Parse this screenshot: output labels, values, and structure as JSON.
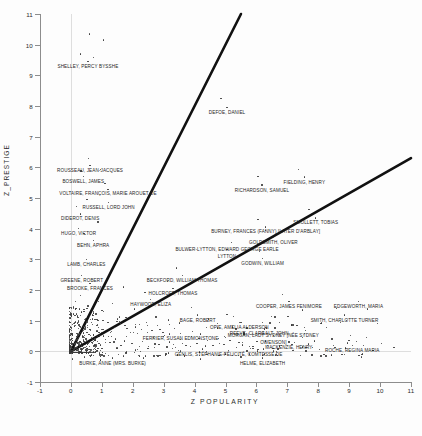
{
  "chart_data": {
    "type": "scatter",
    "title": "",
    "xlabel": "Z  POPULARITY",
    "ylabel": "Z_PRESTIGE",
    "xlim": [
      -1,
      11
    ],
    "ylim": [
      -1,
      11
    ],
    "xticks": [
      -1,
      0,
      1,
      2,
      3,
      4,
      5,
      6,
      7,
      8,
      9,
      10,
      11
    ],
    "ytick_labels": [
      "-1",
      "0",
      "1",
      "2",
      "3",
      "4",
      "5",
      "6",
      "7",
      "8",
      "9",
      "10",
      "11"
    ],
    "xtick_labels": [
      "-1",
      "0",
      "1",
      "2",
      "3",
      "4",
      "5",
      "6",
      "7",
      "8",
      "9",
      "10",
      "11"
    ],
    "yticks": [
      -1,
      0,
      1,
      2,
      3,
      4,
      5,
      6,
      7,
      8,
      9,
      10,
      11
    ],
    "grid": "faint gridlines at x=0 and y=0",
    "legend": "none",
    "reference_lines": [
      {
        "name": "steep-reference-line",
        "x0": 0,
        "y0": 0,
        "x1": 5.5,
        "y1": 11.0
      },
      {
        "name": "shallow-reference-line",
        "x0": 0,
        "y0": 0,
        "x1": 11.0,
        "y1": 6.3
      }
    ],
    "labeled_points": [
      {
        "label": "SHELLEY, PERCY BYSSHE",
        "x": 0.55,
        "y": 9.45
      },
      {
        "label": "DEFOE, DANIEL",
        "x": 5.05,
        "y": 7.95
      },
      {
        "label": "ROUSSEAU, JEAN-JACQUES",
        "x": 0.62,
        "y": 6.05
      },
      {
        "label": "BOSWELL, JAMES",
        "x": 0.4,
        "y": 5.7
      },
      {
        "label": "VOLTAIRE, FRANÇOIS, MARIE AROUET DE",
        "x": 1.2,
        "y": 5.28
      },
      {
        "label": "RUSSELL, LORD JOHN",
        "x": 1.22,
        "y": 4.86
      },
      {
        "label": "DIDEROT, DENIS",
        "x": 0.3,
        "y": 4.48
      },
      {
        "label": "HUGO, VICTOR",
        "x": 0.25,
        "y": 4.0
      },
      {
        "label": "BEHN, APHRA",
        "x": 0.72,
        "y": 3.62
      },
      {
        "label": "RICHARDSON, SAMUEL",
        "x": 6.18,
        "y": 5.42
      },
      {
        "label": "FIELDING, HENRY",
        "x": 7.55,
        "y": 5.68
      },
      {
        "label": "SMOLLETT, TOBIAS",
        "x": 7.92,
        "y": 4.35
      },
      {
        "label": "BURNEY, FRANCES (FANNY) [LATER D'ARBLAY]",
        "x": 6.3,
        "y": 4.05
      },
      {
        "label": "GOLDSMITH, OLIVER",
        "x": 6.55,
        "y": 3.72
      },
      {
        "label": "BULWER-LYTTON, EDWARD GEORGE EARLE LYTTON",
        "x": 5.05,
        "y": 3.32
      },
      {
        "label": "GODWIN, WILLIAM",
        "x": 6.2,
        "y": 3.02
      },
      {
        "label": "LAMB, CHARLES",
        "x": 0.5,
        "y": 3.0
      },
      {
        "label": "GREENE, ROBERT",
        "x": 0.35,
        "y": 2.48
      },
      {
        "label": "BROOKE, FRANCES",
        "x": 0.62,
        "y": 2.22
      },
      {
        "label": "BECKFORD, WILLIAM THOMAS",
        "x": 3.6,
        "y": 2.48
      },
      {
        "label": "HOLCROFT, THOMAS",
        "x": 3.3,
        "y": 2.05
      },
      {
        "label": "HAYWOOD, ELIZA",
        "x": 2.58,
        "y": 1.68
      },
      {
        "label": "COOPER, JAMES FENIMORE",
        "x": 7.05,
        "y": 1.62
      },
      {
        "label": "EDGEWORTH, MARIA",
        "x": 9.3,
        "y": 1.62
      },
      {
        "label": "BAGE, ROBERT",
        "x": 4.1,
        "y": 1.18
      },
      {
        "label": "SMITH, CHARLOTTE TURNER",
        "x": 8.85,
        "y": 1.18
      },
      {
        "label": "OPIE, AMELIA ALDERSON",
        "x": 5.45,
        "y": 0.95
      },
      {
        "label": "REEVE, CLARA",
        "x": 5.7,
        "y": 0.76
      },
      {
        "label": "GALT, JOHN",
        "x": 6.6,
        "y": 0.76
      },
      {
        "label": "FERRIER, SUSAN EDMONSTONE",
        "x": 3.55,
        "y": 0.58
      },
      {
        "label": "MORGAN, LADY SYDNEY [NÉE SYDNEY OWENSON]",
        "x": 6.55,
        "y": 0.52
      },
      {
        "label": "MACKENZIE, HENRY",
        "x": 7.05,
        "y": 0.3
      },
      {
        "label": "ROCHE, REGINA MARIA",
        "x": 9.1,
        "y": 0.2
      },
      {
        "label": "GENLIS, STÉPHANIE-FÉLICITÉ, COMTESSE DE",
        "x": 5.1,
        "y": 0.02
      },
      {
        "label": "HELME, ELIZABETH",
        "x": 6.2,
        "y": -0.22
      },
      {
        "label": "BURKE, ANNE (MRS. BURKE)",
        "x": 1.35,
        "y": -0.22
      }
    ],
    "unlabeled_points": [
      [
        0.6,
        10.35
      ],
      [
        1.05,
        10.15
      ],
      [
        0.3,
        9.7
      ],
      [
        0.72,
        9.58
      ],
      [
        0.58,
        6.28
      ],
      [
        0.33,
        5.88
      ],
      [
        0.95,
        5.92
      ],
      [
        1.1,
        5.48
      ],
      [
        0.52,
        4.95
      ],
      [
        0.18,
        4.72
      ],
      [
        0.88,
        4.22
      ],
      [
        0.42,
        3.85
      ],
      [
        4.85,
        8.25
      ],
      [
        6.05,
        5.7
      ],
      [
        7.35,
        5.92
      ],
      [
        7.7,
        4.62
      ],
      [
        6.05,
        4.3
      ],
      [
        6.3,
        3.95
      ],
      [
        5.2,
        3.55
      ],
      [
        6.1,
        3.25
      ],
      [
        3.42,
        2.72
      ],
      [
        3.12,
        2.28
      ],
      [
        2.4,
        1.92
      ],
      [
        1.7,
        2.1
      ],
      [
        1.35,
        1.55
      ],
      [
        1.05,
        1.3
      ],
      [
        0.9,
        1.62
      ],
      [
        1.5,
        1.05
      ],
      [
        2.05,
        1.38
      ],
      [
        2.75,
        1.12
      ],
      [
        3.2,
        0.88
      ],
      [
        3.9,
        1.42
      ],
      [
        4.45,
        1.05
      ],
      [
        5.05,
        1.2
      ],
      [
        5.6,
        0.62
      ],
      [
        6.2,
        0.95
      ],
      [
        6.85,
        1.85
      ],
      [
        7.5,
        1.35
      ],
      [
        8.1,
        0.92
      ],
      [
        8.6,
        1.4
      ],
      [
        9.05,
        0.52
      ],
      [
        9.6,
        1.38
      ],
      [
        10.05,
        0.25
      ],
      [
        10.45,
        0.12
      ],
      [
        0.15,
        0.85
      ],
      [
        0.22,
        1.15
      ],
      [
        0.08,
        1.45
      ],
      [
        0.3,
        0.62
      ],
      [
        0.45,
        0.45
      ],
      [
        0.62,
        0.72
      ],
      [
        0.78,
        0.35
      ],
      [
        0.95,
        0.52
      ],
      [
        1.12,
        0.28
      ],
      [
        1.28,
        0.62
      ],
      [
        1.45,
        0.4
      ],
      [
        1.62,
        0.18
      ],
      [
        1.8,
        0.48
      ],
      [
        1.98,
        0.25
      ],
      [
        2.15,
        0.58
      ],
      [
        2.32,
        0.32
      ],
      [
        2.5,
        0.15
      ],
      [
        2.68,
        0.45
      ],
      [
        2.85,
        0.22
      ],
      [
        3.02,
        0.52
      ],
      [
        3.2,
        0.3
      ],
      [
        3.38,
        0.12
      ],
      [
        3.55,
        0.38
      ],
      [
        3.72,
        0.2
      ],
      [
        3.9,
        0.48
      ],
      [
        4.08,
        0.25
      ],
      [
        4.25,
        0.08
      ],
      [
        4.42,
        0.35
      ],
      [
        4.6,
        0.18
      ],
      [
        4.78,
        0.42
      ],
      [
        4.95,
        0.22
      ],
      [
        5.15,
        0.35
      ],
      [
        5.35,
        0.12
      ],
      [
        5.55,
        0.28
      ],
      [
        5.78,
        0.15
      ],
      [
        6.02,
        0.32
      ],
      [
        6.35,
        0.18
      ],
      [
        6.7,
        0.08
      ],
      [
        7.15,
        0.22
      ],
      [
        7.6,
        0.12
      ],
      [
        8.05,
        0.05
      ],
      [
        8.5,
        0.18
      ],
      [
        0.05,
        0.25
      ],
      [
        0.1,
        0.05
      ],
      [
        0.18,
        0.38
      ],
      [
        0.28,
        0.18
      ],
      [
        0.38,
        0.08
      ],
      [
        0.05,
        0.58
      ],
      [
        0.12,
        0.92
      ],
      [
        0.2,
        0.48
      ],
      [
        0.08,
        1.22
      ],
      [
        0.25,
        0.95
      ],
      [
        0.35,
        1.28
      ],
      [
        0.48,
        1.05
      ],
      [
        0.15,
        1.62
      ],
      [
        0.32,
        1.82
      ],
      [
        0.55,
        1.48
      ],
      [
        0.7,
        1.18
      ],
      [
        0.85,
        0.88
      ],
      [
        1.0,
        0.72
      ],
      [
        1.2,
        0.95
      ],
      [
        1.4,
        0.78
      ],
      [
        1.58,
        1.12
      ],
      [
        1.75,
        0.85
      ],
      [
        1.92,
        0.62
      ],
      [
        2.1,
        0.88
      ],
      [
        2.28,
        0.72
      ],
      [
        2.45,
        0.95
      ],
      [
        2.62,
        0.68
      ],
      [
        2.8,
        0.85
      ],
      [
        2.98,
        0.62
      ],
      [
        3.15,
        1.02
      ],
      [
        3.35,
        0.75
      ],
      [
        3.52,
        0.92
      ],
      [
        0.05,
        -0.25
      ],
      [
        0.45,
        -0.18
      ],
      [
        0.95,
        -0.28
      ],
      [
        1.7,
        -0.15
      ],
      [
        2.35,
        -0.22
      ],
      [
        3.05,
        -0.12
      ],
      [
        4.2,
        -0.25
      ],
      [
        5.5,
        -0.18
      ],
      [
        7.8,
        -0.12
      ],
      [
        9.4,
        -0.18
      ]
    ]
  }
}
